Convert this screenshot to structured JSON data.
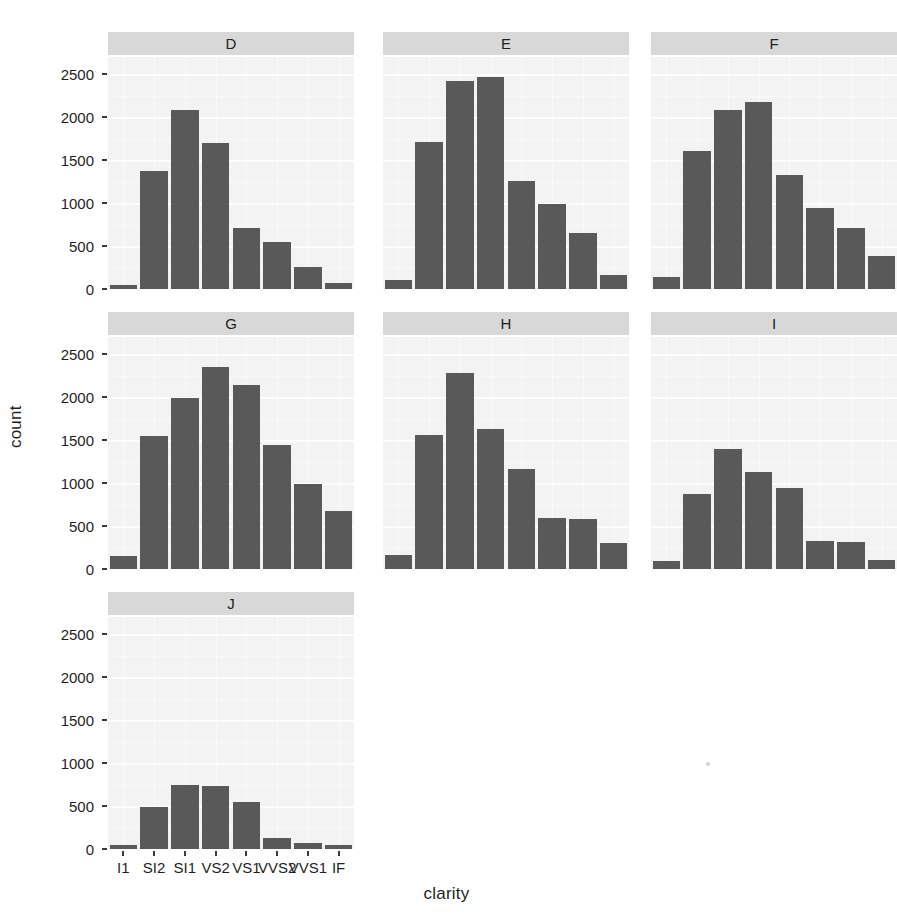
{
  "chart_data": {
    "type": "bar",
    "title": "",
    "subtitle": "",
    "xlabel": "clarity",
    "ylabel": "count",
    "facet_variable": "color",
    "facet_layout": "wrap, 3 columns",
    "grid": true,
    "legend": "none",
    "bar_color": "#595959",
    "panel_background": "#f3f3f3",
    "strip_background": "#d8d8d8",
    "categories": [
      "I1",
      "SI2",
      "SI1",
      "VS2",
      "VS1",
      "VVS2",
      "VVS1",
      "IF"
    ],
    "ylim": [
      0,
      2700
    ],
    "yticks": [
      0,
      500,
      1000,
      1500,
      2000,
      2500
    ],
    "ytick_labels": [
      "0",
      "500",
      "1000",
      "1500",
      "2000",
      "2500"
    ],
    "panels": [
      {
        "label": "D",
        "values": [
          42,
          1370,
          2083,
          1697,
          705,
          552,
          252,
          73
        ]
      },
      {
        "label": "E",
        "values": [
          102,
          1713,
          2426,
          2470,
          1259,
          991,
          656,
          158
        ]
      },
      {
        "label": "F",
        "values": [
          143,
          1609,
          2081,
          2171,
          1328,
          944,
          714,
          385
        ]
      },
      {
        "label": "G",
        "values": [
          150,
          1545,
          1989,
          2347,
          2137,
          1443,
          988,
          681
        ]
      },
      {
        "label": "H",
        "values": [
          162,
          1565,
          2282,
          1632,
          1169,
          595,
          577,
          299
        ]
      },
      {
        "label": "I",
        "values": [
          92,
          878,
          1395,
          1134,
          942,
          330,
          312,
          108
        ]
      },
      {
        "label": "J",
        "values": [
          50,
          491,
          750,
          736,
          542,
          131,
          71,
          51
        ]
      }
    ]
  }
}
